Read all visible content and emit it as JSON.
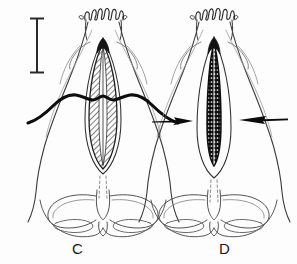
{
  "figure": {
    "type": "scientific-line-drawing",
    "background_color": "#fdfdfd",
    "ink_color": "#1a1a1a",
    "width": 297,
    "height": 264
  },
  "panels": [
    {
      "id": "C",
      "label": "C",
      "label_x": 72,
      "label_y": 240,
      "center_x": 103,
      "notes": "Left panel. Central aedeagus-like organ shown as broad hatched lanceolate body; a heavy black transverse sinuous band crosses the specimen at mid-level.",
      "features": {
        "apical_crest": "wavy scalloped crest across the apex",
        "median_organ": "broad hatched lanceolate structure",
        "transverse_band": "thick black sinuous line crossing mid-body",
        "basal_lobes": "paired wing-like basal lobes with elongate oval inclusions"
      }
    },
    {
      "id": "D",
      "label": "D",
      "label_x": 219,
      "label_y": 240,
      "center_x": 214,
      "notes": "Right panel. Central organ is a narrow elongate dark rod with beaded internal texture; two solid black arrows point inward from left and right toward the organ.",
      "features": {
        "apical_crest": "wavy scalloped crest across the apex",
        "median_organ": "narrow elongate dark rod with beaded texture",
        "basal_lobes": "paired wing-like basal lobes with elongate oval inclusions"
      }
    }
  ],
  "scale_bar": {
    "name": "scale-bar",
    "x": 37,
    "y_top": 18,
    "y_bottom": 73,
    "orientation": "vertical",
    "cap_style": "serif-cap",
    "label": ""
  },
  "annotations": [
    {
      "name": "arrow-left",
      "shape": "solid-black-arrow",
      "direction": "right",
      "tail_x": 152,
      "tip_x": 193,
      "y": 121,
      "panel": "D"
    },
    {
      "name": "arrow-right",
      "shape": "solid-black-arrow",
      "direction": "left",
      "tail_x": 288,
      "tip_x": 239,
      "y": 119,
      "panel": "D"
    }
  ],
  "colors": {
    "ink": "#1a1a1a",
    "light_ink": "#6a6a6a",
    "hatch": "#3d3d3d",
    "background": "#fdfdfd"
  }
}
